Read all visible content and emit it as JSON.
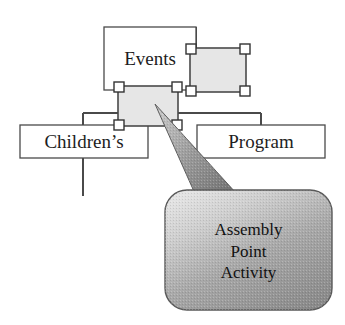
{
  "diagram": {
    "colors": {
      "stroke": "#4a4a4a",
      "box_fill": "#ffffff",
      "selected_fill": "#e6e6e6",
      "handle_stroke": "#3a3a3a",
      "handle_fill": "#ffffff",
      "callout_fill_light": "#d8d8d8",
      "callout_fill_dark": "#8f8f8f",
      "callout_stroke": "#5a5a5a",
      "tail_fill_light": "#d2d2d2",
      "tail_fill_dark": "#777777",
      "text": "#1d1d1d"
    },
    "nodes": [
      {
        "id": "events",
        "label": "Events",
        "selected": false
      },
      {
        "id": "childrens",
        "label": "Children’s",
        "selected": false
      },
      {
        "id": "program",
        "label": "Program",
        "selected": false
      }
    ],
    "selected_shapes": [
      {
        "id": "selected-shape-left",
        "label": "",
        "handles": 4
      },
      {
        "id": "selected-shape-right",
        "label": "",
        "handles": 4
      }
    ],
    "callout": {
      "lines": [
        "Assembly",
        "Point",
        "Activity"
      ],
      "line1": "Assembly",
      "line2": "Point",
      "line3": "Activity"
    }
  }
}
